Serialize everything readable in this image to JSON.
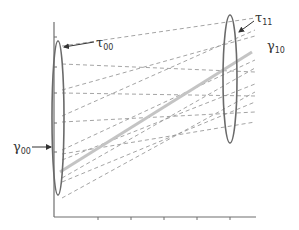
{
  "diagram": {
    "title": "",
    "colors": {
      "axis": "#6f6f6f",
      "ellipse": "#6a6a6a",
      "dashed_line": "#9a9a9a",
      "mean_line": "#c4c4c4",
      "text": "#333333"
    },
    "labels": {
      "tau00": {
        "base": "τ",
        "sub": "00"
      },
      "tau11": {
        "base": "τ",
        "sub": "11"
      },
      "gamma10": {
        "base": "γ",
        "sub": "10"
      },
      "gamma00": {
        "base": "γ",
        "sub": "00"
      }
    },
    "axes": {
      "origin": [
        54,
        217
      ],
      "y_top": 22,
      "x_right": 256,
      "y_ticks": [
        37,
        67,
        93,
        123,
        152
      ],
      "x_ticks": [
        98,
        131,
        164,
        197,
        230
      ]
    },
    "ellipses": [
      {
        "name": "intercept-variance-ellipse",
        "cx": 58,
        "cy": 118,
        "rx": 6,
        "ry": 77
      },
      {
        "name": "slope-variance-ellipse",
        "cx": 230,
        "cy": 79,
        "rx": 7,
        "ry": 64
      }
    ],
    "mean_line": {
      "x1": 60,
      "y1": 172,
      "x2": 252,
      "y2": 52
    },
    "individual_lines": [
      {
        "x1": 62,
        "y1": 46,
        "x2": 255,
        "y2": 18
      },
      {
        "x1": 62,
        "y1": 64,
        "x2": 255,
        "y2": 72
      },
      {
        "x1": 62,
        "y1": 90,
        "x2": 255,
        "y2": 36
      },
      {
        "x1": 62,
        "y1": 93,
        "x2": 255,
        "y2": 96
      },
      {
        "x1": 62,
        "y1": 116,
        "x2": 255,
        "y2": 30
      },
      {
        "x1": 62,
        "y1": 122,
        "x2": 255,
        "y2": 112
      },
      {
        "x1": 62,
        "y1": 150,
        "x2": 255,
        "y2": 60
      },
      {
        "x1": 62,
        "y1": 154,
        "x2": 255,
        "y2": 122
      },
      {
        "x1": 62,
        "y1": 160,
        "x2": 255,
        "y2": 84
      },
      {
        "x1": 62,
        "y1": 178,
        "x2": 255,
        "y2": 68
      },
      {
        "x1": 62,
        "y1": 182,
        "x2": 255,
        "y2": 102
      },
      {
        "x1": 62,
        "y1": 198,
        "x2": 255,
        "y2": 92
      }
    ],
    "arrows": [
      {
        "name": "tau00-arrow",
        "x1": 94,
        "y1": 42,
        "x2": 64,
        "y2": 47
      },
      {
        "name": "tau11-arrow",
        "x1": 254,
        "y1": 21,
        "x2": 239,
        "y2": 32
      },
      {
        "name": "gamma00-arrow",
        "x1": 32,
        "y1": 147,
        "x2": 51,
        "y2": 147
      }
    ]
  }
}
